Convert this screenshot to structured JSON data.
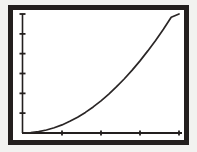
{
  "figure": {
    "background_color": "#f2f2f0",
    "plot_background_color": "#ffffff",
    "frame_color": "#231f1e",
    "frame_width_px": 5,
    "axis_color": "#231f1e",
    "curve_color": "#2a2626"
  },
  "chart_data": {
    "type": "line",
    "title": "",
    "subtitle": "",
    "xlabel": "",
    "ylabel": "",
    "legend": [],
    "legend_position": "none",
    "grid": false,
    "annotations": [],
    "xtick_labels": [],
    "ytick_labels": [],
    "xlim": [
      0,
      1
    ],
    "ylim": [
      0,
      1
    ],
    "x_tick_count": 5,
    "y_tick_count": 7,
    "x_tick_positions": [
      0.0,
      0.25,
      0.5,
      0.75,
      1.0
    ],
    "y_tick_positions": [
      0.0,
      0.167,
      0.333,
      0.5,
      0.667,
      0.833,
      1.0
    ],
    "series": [
      {
        "name": "curve",
        "style": "solid",
        "color": "#2a2626",
        "x": [
          0.0,
          0.05,
          0.1,
          0.15,
          0.2,
          0.25,
          0.3,
          0.35,
          0.4,
          0.45,
          0.5,
          0.55,
          0.6,
          0.65,
          0.7,
          0.75,
          0.8,
          0.85,
          0.9,
          0.95,
          1.0
        ],
        "y": [
          0.0,
          0.003,
          0.011,
          0.025,
          0.044,
          0.068,
          0.098,
          0.133,
          0.173,
          0.219,
          0.27,
          0.327,
          0.389,
          0.456,
          0.528,
          0.606,
          0.69,
          0.778,
          0.872,
          0.972,
          1.0
        ]
      }
    ]
  }
}
